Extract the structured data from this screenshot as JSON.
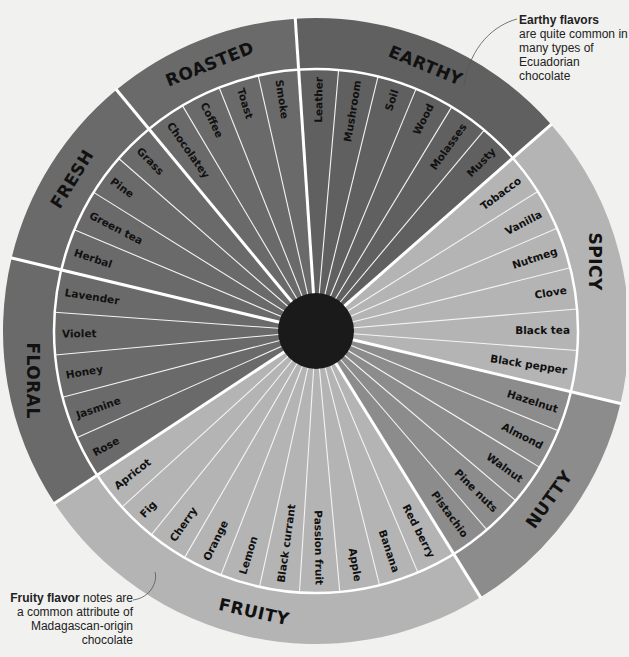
{
  "chart_data": {
    "type": "wheel",
    "center": {
      "cx": 316,
      "cy": 331,
      "hub_radius": 38
    },
    "radii": {
      "inner": 262,
      "outer": 313
    },
    "categories": [
      {
        "name": "EARTHY",
        "start": -3.8,
        "end": 48.7,
        "color": "#606060",
        "items": [
          "Leather",
          "Mushroom",
          "Soil",
          "Wood",
          "Molasses",
          "Musty"
        ]
      },
      {
        "name": "SPICY",
        "start": 48.7,
        "end": 103.4,
        "color": "#b4b4b4",
        "items": [
          "Tobacco",
          "Vanilla",
          "Nutmeg",
          "Clove",
          "Black tea",
          "Black pepper"
        ]
      },
      {
        "name": "NUTTY",
        "start": 103.4,
        "end": 148.3,
        "color": "#8c8c8c",
        "items": [
          "Hazelnut",
          "Almond",
          "Walnut",
          "Pine nuts",
          "Pistachio"
        ]
      },
      {
        "name": "FRUITY",
        "start": 148.3,
        "end": 236.6,
        "color": "#b4b4b4",
        "items": [
          "Red berry",
          "Banana",
          "Apple",
          "Passion fruit",
          "Black currant",
          "Lemon",
          "Orange",
          "Cherry",
          "Fig",
          "Apricot"
        ]
      },
      {
        "name": "FLORAL",
        "start": 236.6,
        "end": 283.5,
        "color": "#6a6a6a",
        "items": [
          "Rose",
          "Jasmine",
          "Honey",
          "Violet",
          "Lavender"
        ]
      },
      {
        "name": "FRESH",
        "start": 283.5,
        "end": 320.4,
        "color": "#6a6a6a",
        "items": [
          "Herbal",
          "Green tea",
          "Pine",
          "Grass"
        ]
      },
      {
        "name": "ROASTED",
        "start": 320.4,
        "end": 356.2,
        "color": "#6a6a6a",
        "items": [
          "Chocolatey",
          "Coffee",
          "Toast",
          "Smoke"
        ]
      }
    ]
  },
  "annotations": {
    "earthy": {
      "bold": "Earthy flavors",
      "text": "are quite common in many types of Ecuadorian chocolate"
    },
    "fruity": {
      "bold": "Fruity flavor",
      "text": "notes are a common attribute of Madagascan-origin chocolate"
    }
  },
  "colors": {
    "hub": "#1a1a1a",
    "divider": "#ffffff",
    "background": "#f1f1ef"
  }
}
